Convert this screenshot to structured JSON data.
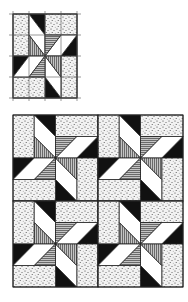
{
  "figure": {
    "single_block": {
      "grid": "4x4",
      "guide_lines": true
    },
    "quilt_layout": {
      "rows": 2,
      "cols": 2
    },
    "fabrics": {
      "speckled": "#d8d8d8",
      "black": "#111111",
      "white": "#ffffff",
      "hatched": "#9a9a9a",
      "outline": "#222222"
    }
  }
}
